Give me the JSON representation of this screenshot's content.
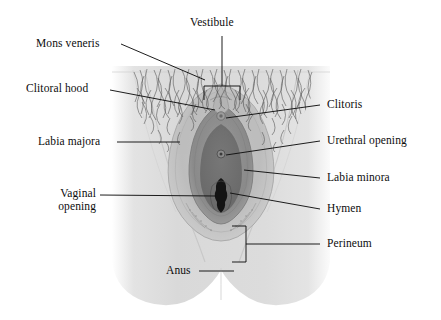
{
  "figure": {
    "background_color": "#ffffff",
    "body_fill_color": "#d9d9d9",
    "labia_majora_color": "#b9b9b9",
    "labia_minora_color": "#8e8e8e",
    "vestibule_color": "#6f6f6f",
    "opening_color": "#151515",
    "hair_color": "#4a4a4a",
    "leader_line_color": "#111111",
    "label_text_color": "#0d0d0d"
  },
  "labels": {
    "vestibule": {
      "text": "Vestibule",
      "side": "top"
    },
    "mons_veneris": {
      "text": "Mons veneris",
      "side": "left"
    },
    "clitoral_hood": {
      "text": "Clitoral hood",
      "side": "left"
    },
    "labia_majora": {
      "text": "Labia majora",
      "side": "left"
    },
    "vaginal_opening_1": {
      "text": "Vaginal",
      "side": "left"
    },
    "vaginal_opening_2": {
      "text": "opening",
      "side": "left"
    },
    "anus": {
      "text": "Anus",
      "side": "left"
    },
    "clitoris": {
      "text": "Clitoris",
      "side": "right"
    },
    "urethral_opening": {
      "text": "Urethral opening",
      "side": "right"
    },
    "labia_minora": {
      "text": "Labia minora",
      "side": "right"
    },
    "hymen": {
      "text": "Hymen",
      "side": "right"
    },
    "perineum": {
      "text": "Perineum",
      "side": "right"
    }
  }
}
